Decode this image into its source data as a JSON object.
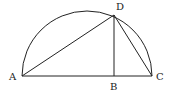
{
  "diagram": {
    "type": "geometry",
    "points": {
      "A": {
        "label": "A",
        "x": 22,
        "y": 76
      },
      "B": {
        "label": "B",
        "x": 114,
        "y": 76
      },
      "C": {
        "label": "C",
        "x": 152,
        "y": 76
      },
      "D": {
        "label": "D",
        "x": 114,
        "y": 15
      }
    },
    "segments": [
      "AC",
      "AD",
      "DB",
      "DC"
    ],
    "arc": {
      "from": "A",
      "to": "C",
      "type": "semicircle"
    },
    "stroke_color": "#222222"
  }
}
